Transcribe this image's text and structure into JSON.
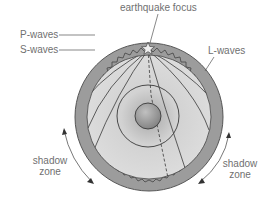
{
  "diagram": {
    "labels": {
      "focus": "earthquake focus",
      "p_waves": "P-waves",
      "s_waves": "S-waves",
      "l_waves": "L-waves",
      "shadow_left_line1": "shadow",
      "shadow_left_line2": "zone",
      "shadow_right_line1": "shadow",
      "shadow_right_line2": "zone"
    },
    "colors": {
      "crust": "#9a9a9a",
      "mantle": "#d6d6d6",
      "core_outer": "#c4c4c4",
      "core_inner": "#8a8a8a",
      "line": "#3a3a3a",
      "text": "#707070"
    },
    "geometry": {
      "center": [
        149,
        117
      ],
      "outer_radius": 74,
      "mantle_radius": 62,
      "outer_core_radius": 31,
      "inner_core_radius": 13,
      "focus": [
        148,
        47
      ]
    }
  }
}
